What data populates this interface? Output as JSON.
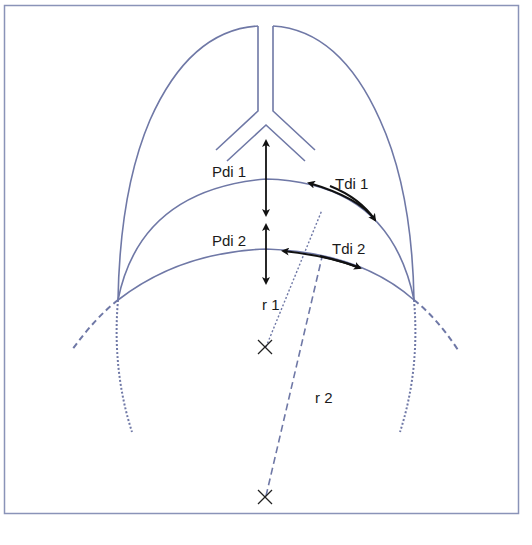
{
  "diagram": {
    "colors": {
      "frame": "#8a93b8",
      "lung_outline": "#6f78a6",
      "arrow": "#111111",
      "radius_line": "#6f78a6",
      "center_mark": "#222222",
      "background": "#ffffff"
    },
    "labels": {
      "pdi1": "Pdi 1",
      "pdi2": "Pdi 2",
      "tdi1": "Tdi 1",
      "tdi2": "Tdi 2",
      "r1": "r 1",
      "r2": "r 2"
    },
    "elements": [
      {
        "name": "frame",
        "description": "rectangular border"
      },
      {
        "name": "lung-outline",
        "description": "lung silhouette with trachea and main bronchi"
      },
      {
        "name": "diaphragm-curve-1",
        "description": "upper diaphragm dome (smaller radius r1)"
      },
      {
        "name": "diaphragm-curve-2",
        "description": "lower diaphragm dome (larger radius r2)"
      },
      {
        "name": "circle-extension-1",
        "description": "dotted continuation of circle with radius r1"
      },
      {
        "name": "circle-extension-2",
        "description": "dashed continuation of circle with radius r2"
      },
      {
        "name": "pdi-arrows",
        "description": "vertical double arrows for Pdi 1 and Pdi 2"
      },
      {
        "name": "tdi-arrows",
        "description": "curved double arrows along domes for Tdi 1 and Tdi 2"
      },
      {
        "name": "radius-r1",
        "description": "dotted line from centre 1 to dome 1"
      },
      {
        "name": "radius-r2",
        "description": "dashed line from centre 2 to dome 2"
      },
      {
        "name": "center-marks",
        "description": "X marks at centres of curvature"
      }
    ]
  }
}
